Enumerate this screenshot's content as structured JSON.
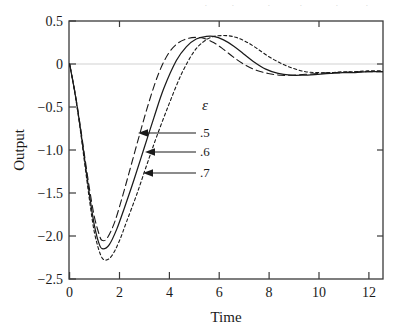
{
  "chart_data": {
    "type": "line",
    "title": "",
    "xlabel": "Time",
    "ylabel": "Output",
    "xlim": [
      0,
      12.6
    ],
    "ylim": [
      -2.5,
      0.5
    ],
    "xticks": [
      "0",
      "2",
      "4",
      "6",
      "8",
      "10",
      "12"
    ],
    "xtick_values": [
      0,
      2,
      4,
      6,
      8,
      10,
      12
    ],
    "yticks": [
      "0.5",
      "0",
      "-0.5",
      "-1.0",
      "-1.5",
      "-2.0",
      "-2.5"
    ],
    "ytick_values": [
      0.5,
      0,
      -0.5,
      -1.0,
      -1.5,
      -2.0,
      -2.5
    ],
    "grid": false,
    "zero_line": true,
    "legend_position": "inside-center",
    "legend_title": "ε",
    "series": [
      {
        "name": ".5",
        "style": "long-dashed",
        "color": "#1a1a1a",
        "minimum": {
          "x": 1.3,
          "y": -2.05
        },
        "peak": {
          "x": 5.4,
          "y": 0.3
        },
        "x": [
          0,
          0.2,
          0.4,
          0.6,
          0.8,
          1.0,
          1.2,
          1.3,
          1.5,
          1.8,
          2.1,
          2.4,
          2.8,
          3.2,
          3.6,
          4.0,
          4.4,
          4.8,
          5.1,
          5.4,
          5.8,
          6.2,
          6.6,
          7.0,
          7.5,
          8.0,
          8.5,
          9.0,
          9.5,
          10.0,
          10.5,
          11.0,
          11.5,
          12.0,
          12.6
        ],
        "y": [
          0,
          -0.3,
          -0.66,
          -1.06,
          -1.45,
          -1.78,
          -1.99,
          -2.05,
          -2.03,
          -1.85,
          -1.57,
          -1.26,
          -0.84,
          -0.44,
          -0.1,
          0.13,
          0.25,
          0.3,
          0.31,
          0.3,
          0.25,
          0.17,
          0.08,
          0.0,
          -0.07,
          -0.11,
          -0.13,
          -0.13,
          -0.12,
          -0.11,
          -0.1,
          -0.1,
          -0.09,
          -0.09,
          -0.09
        ]
      },
      {
        "name": ".6",
        "style": "solid",
        "color": "#1a1a1a",
        "minimum": {
          "x": 1.35,
          "y": -2.15
        },
        "peak": {
          "x": 5.8,
          "y": 0.32
        },
        "x": [
          0,
          0.2,
          0.4,
          0.6,
          0.8,
          1.0,
          1.2,
          1.35,
          1.6,
          1.9,
          2.2,
          2.6,
          3.0,
          3.4,
          3.8,
          4.3,
          4.7,
          5.1,
          5.5,
          5.8,
          6.2,
          6.6,
          7.0,
          7.4,
          7.9,
          8.4,
          8.9,
          9.4,
          10.0,
          10.5,
          11.0,
          11.5,
          12.0,
          12.6
        ],
        "y": [
          0,
          -0.31,
          -0.68,
          -1.1,
          -1.52,
          -1.88,
          -2.1,
          -2.15,
          -2.1,
          -1.92,
          -1.68,
          -1.34,
          -0.98,
          -0.62,
          -0.28,
          0.04,
          0.2,
          0.29,
          0.32,
          0.32,
          0.28,
          0.21,
          0.12,
          0.03,
          -0.06,
          -0.11,
          -0.13,
          -0.13,
          -0.12,
          -0.11,
          -0.1,
          -0.1,
          -0.09,
          -0.09
        ]
      },
      {
        "name": ".7",
        "style": "short-dashed",
        "color": "#1a1a1a",
        "minimum": {
          "x": 1.45,
          "y": -2.28
        },
        "peak": {
          "x": 6.3,
          "y": 0.33
        },
        "x": [
          0,
          0.2,
          0.4,
          0.6,
          0.8,
          1.0,
          1.25,
          1.45,
          1.7,
          2.0,
          2.3,
          2.7,
          3.1,
          3.5,
          4.0,
          4.5,
          5.0,
          5.4,
          5.8,
          6.3,
          6.7,
          7.1,
          7.5,
          8.0,
          8.5,
          9.0,
          9.5,
          10.0,
          10.5,
          11.0,
          11.5,
          12.0,
          12.6
        ],
        "y": [
          0,
          -0.32,
          -0.7,
          -1.14,
          -1.58,
          -1.96,
          -2.22,
          -2.28,
          -2.23,
          -2.06,
          -1.83,
          -1.52,
          -1.18,
          -0.85,
          -0.47,
          -0.12,
          0.14,
          0.26,
          0.32,
          0.33,
          0.31,
          0.26,
          0.19,
          0.09,
          0.01,
          -0.05,
          -0.09,
          -0.1,
          -0.1,
          -0.09,
          -0.09,
          -0.08,
          -0.08
        ]
      }
    ],
    "annotations": [
      {
        "label": ".5",
        "arrow_to_series": ".5"
      },
      {
        "label": ".6",
        "arrow_to_series": ".6"
      },
      {
        "label": ".7",
        "arrow_to_series": ".7"
      }
    ]
  },
  "axes": {
    "x_title": "Time",
    "y_title": "Output",
    "x_tick_labels": [
      "0",
      "2",
      "4",
      "6",
      "8",
      "10",
      "12"
    ],
    "y_tick_labels": [
      "0.5",
      "0",
      "−0.5",
      "−1.0",
      "−1.5",
      "−2.0",
      "−2.5"
    ]
  },
  "legend": {
    "symbol": "ε",
    "entries": [
      ".5",
      ".6",
      ".7"
    ]
  },
  "colors": {
    "line": "#1a1a1a",
    "frame": "#3a3a3a",
    "zero_line": "#cfcfcf",
    "background": "#ffffff"
  }
}
